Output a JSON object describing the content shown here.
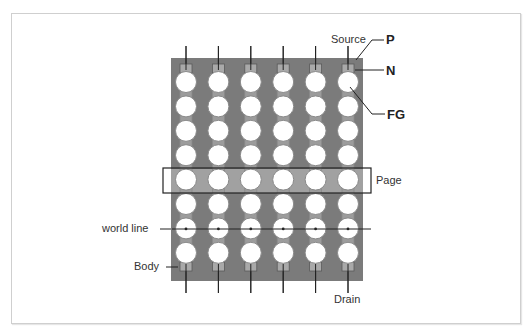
{
  "diagram": {
    "type": "NAND flash memory cell array (schematic)",
    "columns": 6,
    "rows": 8,
    "labels": {
      "source": "Source",
      "p": "P",
      "n": "N",
      "fg": "FG",
      "page": "Page",
      "world_line": "world line",
      "body": "Body",
      "drain": "Drain"
    },
    "highlight": {
      "page_row_index": 4,
      "world_line_row_index": 6
    },
    "colors": {
      "panel": "#7b7b7b",
      "cell_fill": "#ffffff",
      "cell_stroke": "#8a8a8a",
      "contact": "#a9a9a9",
      "page_band": "#b0b0b0",
      "line": "#222222",
      "frame": "#cfcfcf"
    }
  }
}
